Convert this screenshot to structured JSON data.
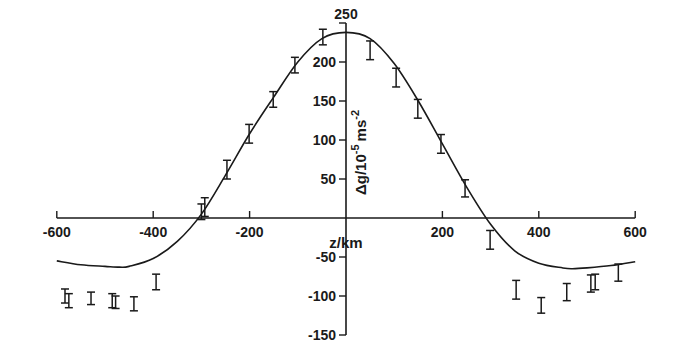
{
  "chart_data": {
    "type": "scatter",
    "title": "",
    "xlabel": "z/km",
    "ylabel": "Δg/10⁻⁵ms⁻²",
    "ylabel_parts": {
      "base": "Δg/10",
      "exp1": "-5",
      "mid": "ms",
      "exp2": "-2"
    },
    "xlim": [
      -600,
      600
    ],
    "ylim": [
      -150,
      250
    ],
    "grid": false,
    "legend": "none",
    "x_ticks": [
      -600,
      -400,
      -200,
      200,
      400,
      600
    ],
    "x_tick_labels": [
      "-600",
      "-400",
      "-200",
      "200",
      "400",
      "600"
    ],
    "y_ticks": [
      250,
      200,
      150,
      100,
      50,
      -50,
      -100,
      -150
    ],
    "y_tick_labels": [
      "250",
      "200",
      "150",
      "100",
      "50",
      "-50",
      "-100",
      "-150"
    ],
    "series": [
      {
        "name": "observed (error bars)",
        "kind": "errorbar",
        "points": [
          {
            "x": -583,
            "y": -100,
            "err": 9
          },
          {
            "x": -575,
            "y": -106,
            "err": 9
          },
          {
            "x": -529,
            "y": -103,
            "err": 8
          },
          {
            "x": -485,
            "y": -106,
            "err": 9
          },
          {
            "x": -478,
            "y": -108,
            "err": 8
          },
          {
            "x": -440,
            "y": -110,
            "err": 9
          },
          {
            "x": -394,
            "y": -82,
            "err": 10
          },
          {
            "x": -300,
            "y": 8,
            "err": 10
          },
          {
            "x": -293,
            "y": 14,
            "err": 12
          },
          {
            "x": -247,
            "y": 62,
            "err": 12
          },
          {
            "x": -201,
            "y": 108,
            "err": 12
          },
          {
            "x": -151,
            "y": 152,
            "err": 10
          },
          {
            "x": -106,
            "y": 196,
            "err": 10
          },
          {
            "x": -48,
            "y": 232,
            "err": 10
          },
          {
            "x": 50,
            "y": 215,
            "err": 12
          },
          {
            "x": 104,
            "y": 180,
            "err": 12
          },
          {
            "x": 149,
            "y": 140,
            "err": 12
          },
          {
            "x": 197,
            "y": 95,
            "err": 12
          },
          {
            "x": 247,
            "y": 38,
            "err": 11
          },
          {
            "x": 299,
            "y": -28,
            "err": 12
          },
          {
            "x": 353,
            "y": -92,
            "err": 12
          },
          {
            "x": 405,
            "y": -112,
            "err": 10
          },
          {
            "x": 458,
            "y": -95,
            "err": 11
          },
          {
            "x": 508,
            "y": -84,
            "err": 11
          },
          {
            "x": 517,
            "y": -82,
            "err": 10
          },
          {
            "x": 565,
            "y": -70,
            "err": 11
          }
        ]
      },
      {
        "name": "model curve",
        "kind": "line",
        "x": [
          -600,
          -550,
          -500,
          -470,
          -450,
          -400,
          -350,
          -300,
          -250,
          -200,
          -150,
          -100,
          -50,
          0,
          50,
          100,
          150,
          200,
          250,
          300,
          350,
          400,
          450,
          470,
          500,
          550,
          600
        ],
        "y": [
          -55,
          -60,
          -62,
          -63,
          -62,
          -52,
          -30,
          5,
          55,
          108,
          155,
          200,
          230,
          238,
          230,
          198,
          150,
          95,
          40,
          -8,
          -42,
          -58,
          -64,
          -65,
          -64,
          -61,
          -56
        ]
      }
    ]
  }
}
